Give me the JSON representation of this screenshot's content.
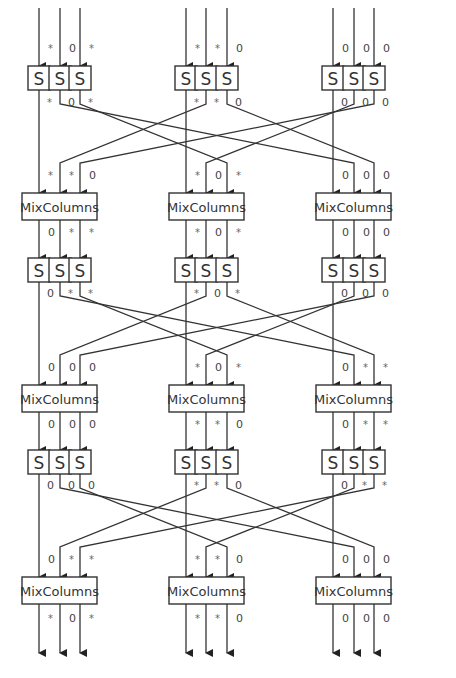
{
  "diagram": {
    "sbox_label": "S",
    "mixcolumns_label": "MixColumns",
    "groups": [
      "A",
      "B",
      "C"
    ],
    "column_x": [
      [
        39,
        60,
        80
      ],
      [
        186,
        206,
        227
      ],
      [
        333,
        354,
        374
      ]
    ],
    "layers": [
      {
        "type": "sbox",
        "y": 66,
        "in_labels": [
          [
            "*",
            "0",
            "*"
          ],
          [
            "*",
            "*",
            "0"
          ],
          [
            "0",
            "0",
            "0"
          ]
        ],
        "out_labels": [
          [
            "*",
            "0",
            "*"
          ],
          [
            "*",
            "*",
            "0"
          ],
          [
            "0",
            "0",
            "0"
          ]
        ]
      },
      {
        "type": "mixcolumns",
        "y": 193,
        "in_labels": [
          [
            "*",
            "*",
            "0"
          ],
          [
            "*",
            "0",
            "*"
          ],
          [
            "0",
            "0",
            "0"
          ]
        ],
        "out_labels": [
          [
            "0",
            "*",
            "*"
          ],
          [
            "*",
            "0",
            "*"
          ],
          [
            "0",
            "0",
            "0"
          ]
        ]
      },
      {
        "type": "sbox",
        "y": 258,
        "out_labels": [
          [
            "0",
            "*",
            "*"
          ],
          [
            "*",
            "0",
            "*"
          ],
          [
            "0",
            "0",
            "0"
          ]
        ]
      },
      {
        "type": "mixcolumns",
        "y": 385,
        "in_labels": [
          [
            "0",
            "0",
            "0"
          ],
          [
            "*",
            "0",
            "*"
          ],
          [
            "0",
            "*",
            "*"
          ]
        ],
        "out_labels": [
          [
            "0",
            "0",
            "0"
          ],
          [
            "*",
            "*",
            "0"
          ],
          [
            "0",
            "*",
            "*"
          ]
        ]
      },
      {
        "type": "sbox",
        "y": 450,
        "out_labels": [
          [
            "0",
            "0",
            "0"
          ],
          [
            "*",
            "*",
            "0"
          ],
          [
            "0",
            "*",
            "*"
          ]
        ]
      },
      {
        "type": "mixcolumns",
        "y": 577,
        "in_labels": [
          [
            "0",
            "*",
            "*"
          ],
          [
            "*",
            "*",
            "0"
          ],
          [
            "0",
            "0",
            "0"
          ]
        ],
        "out_labels": [
          [
            "*",
            "0",
            "*"
          ],
          [
            "*",
            "*",
            "0"
          ],
          [
            "0",
            "0",
            "0"
          ]
        ]
      }
    ],
    "legend": {
      "active": "*",
      "inactive": "0"
    }
  }
}
